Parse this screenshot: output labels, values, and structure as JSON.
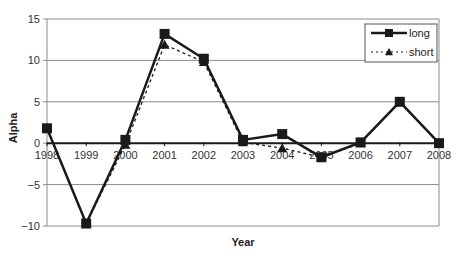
{
  "chart_data": {
    "type": "line",
    "title": "",
    "xlabel": "Year",
    "ylabel": "Alpha",
    "x": [
      "1998",
      "1999",
      "2000",
      "2001",
      "2002",
      "2003",
      "2004",
      "2005",
      "2006",
      "2007",
      "2008"
    ],
    "ylim": [
      -10,
      15
    ],
    "yticks": [
      -10,
      -5,
      0,
      5,
      10,
      15
    ],
    "ytick_labels": [
      "−10",
      "−5",
      "0",
      "5",
      "10",
      "15"
    ],
    "grid": true,
    "legend_position": "top-right",
    "series": [
      {
        "name": "long",
        "style": "solid",
        "marker": "square",
        "color": "#1a1a1a",
        "values": [
          1.8,
          -9.7,
          0.4,
          13.2,
          10.2,
          0.4,
          1.1,
          -1.7,
          0.1,
          5.0,
          0.0
        ]
      },
      {
        "name": "short",
        "style": "dotted",
        "marker": "triangle",
        "color": "#1a1a1a",
        "values": [
          1.8,
          -9.7,
          -0.2,
          11.9,
          9.8,
          0.1,
          -0.6,
          -1.7,
          0.0,
          5.0,
          0.0
        ]
      }
    ]
  },
  "colors": {
    "gridline": "#8c8c8c",
    "axis": "#1a1a1a",
    "plot_border": "#8c8c8c"
  }
}
